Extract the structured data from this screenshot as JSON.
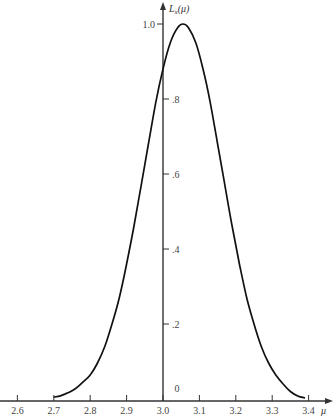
{
  "chart_data": {
    "type": "line",
    "title": "",
    "xlabel": "μ",
    "ylabel": "L_x(μ)",
    "xlim": [
      2.6,
      3.4
    ],
    "ylim": [
      0,
      1.0
    ],
    "grid": false,
    "legend": null,
    "x_ticks": [
      2.6,
      2.7,
      2.8,
      2.9,
      3.0,
      3.1,
      3.2,
      3.3,
      3.4
    ],
    "x_tick_labels": [
      "2.6",
      "2.7",
      "2.8",
      "2.9",
      "3.0",
      "3.1",
      "3.2",
      "3.3",
      "3.4"
    ],
    "y_ticks": [
      0,
      0.2,
      0.4,
      0.6,
      0.8,
      1.0
    ],
    "y_tick_labels": [
      "0",
      ".2",
      ".4",
      ".6",
      ".8",
      "1.0"
    ],
    "series": [
      {
        "name": "L_x(μ)",
        "x": [
          2.7,
          2.72,
          2.74,
          2.76,
          2.78,
          2.8,
          2.82,
          2.84,
          2.86,
          2.88,
          2.9,
          2.92,
          2.94,
          2.96,
          2.98,
          3.0,
          3.02,
          3.04,
          3.055,
          3.07,
          3.09,
          3.11,
          3.13,
          3.15,
          3.17,
          3.19,
          3.21,
          3.23,
          3.25,
          3.27,
          3.29,
          3.31,
          3.33,
          3.35,
          3.37,
          3.39
        ],
        "values": [
          0.005,
          0.009,
          0.017,
          0.028,
          0.045,
          0.064,
          0.096,
          0.14,
          0.2,
          0.27,
          0.36,
          0.46,
          0.57,
          0.68,
          0.79,
          0.88,
          0.95,
          0.99,
          1.0,
          0.99,
          0.95,
          0.88,
          0.79,
          0.68,
          0.57,
          0.46,
          0.36,
          0.27,
          0.2,
          0.14,
          0.096,
          0.064,
          0.04,
          0.02,
          0.008,
          0.003
        ]
      }
    ]
  }
}
